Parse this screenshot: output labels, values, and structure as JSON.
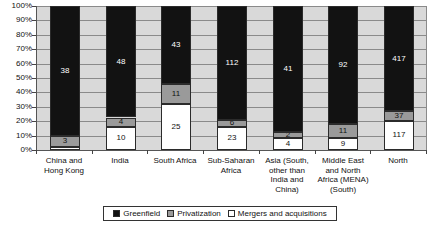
{
  "chart_data": {
    "type": "bar",
    "variant": "stacked-100-percent",
    "title": "",
    "xlabel": "",
    "ylabel": "",
    "ylim": [
      0,
      100
    ],
    "ytick_labels": [
      "100%",
      "90%",
      "80%",
      "70%",
      "60%",
      "50%",
      "40%",
      "30%",
      "20%",
      "10%",
      "0%"
    ],
    "ytick_values": [
      100,
      90,
      80,
      70,
      60,
      50,
      40,
      30,
      20,
      10,
      0
    ],
    "grid": true,
    "legend_position": "bottom",
    "categories": [
      "China and Hong Kong",
      "India",
      "South Africa",
      "Sub-Saharan Africa",
      "Asia (South, other than India and China)",
      "Middle East and North Africa (MENA) (South)",
      "North"
    ],
    "category_lines": [
      [
        "China and",
        "Hong Kong"
      ],
      [
        "India"
      ],
      [
        "South Africa"
      ],
      [
        "Sub-Saharan",
        "Africa"
      ],
      [
        "Asia (South,",
        "other than",
        "India and",
        "China)"
      ],
      [
        "Middle East",
        "and North",
        "Africa (MENA)",
        "(South)"
      ],
      [
        "North"
      ]
    ],
    "stack_order_bottom_to_top": [
      "Mergers and acquisitions",
      "Privatization",
      "Greenfield"
    ],
    "series": [
      {
        "name": "Greenfield",
        "color": "#121212",
        "values": [
          38,
          48,
          43,
          112,
          41,
          92,
          417
        ],
        "labels": [
          "38",
          "48",
          "43",
          "112",
          "41",
          "92",
          "417"
        ]
      },
      {
        "name": "Privatization",
        "color": "#9a9a9a",
        "values": [
          3,
          4,
          11,
          6,
          2,
          11,
          37
        ],
        "labels": [
          "3",
          "4",
          "11",
          "6",
          "2",
          "11",
          "37"
        ]
      },
      {
        "name": "Mergers and acquisitions",
        "color": "#ffffff",
        "values": [
          1,
          10,
          25,
          23,
          4,
          9,
          117
        ],
        "labels": [
          "",
          "10",
          "25",
          "23",
          "4",
          "9",
          "117"
        ]
      }
    ]
  },
  "legend": {
    "items": [
      {
        "label": "Greenfield",
        "icon": "square-black-swatch"
      },
      {
        "label": "Privatization",
        "icon": "square-gray-swatch"
      },
      {
        "label": "Mergers and acquisitions",
        "icon": "square-white-swatch"
      }
    ]
  }
}
